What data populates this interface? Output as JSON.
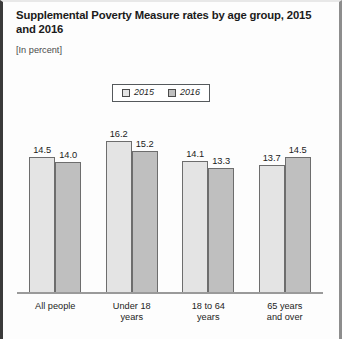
{
  "chart_data": {
    "type": "bar",
    "title": "Supplemental Poverty Measure rates by age group, 2015 and 2016",
    "subtitle": "[In percent]",
    "xlabel": "",
    "ylabel": "",
    "ylim": [
      0,
      18.5
    ],
    "grid": false,
    "legend_position": "top-center",
    "categories": [
      "All people",
      "Under 18 years",
      "18 to 64 years",
      "65 years and over"
    ],
    "category_lines": [
      {
        "line1": "All people",
        "line2": ""
      },
      {
        "line1": "Under 18",
        "line2": "years"
      },
      {
        "line1": "18 to 64",
        "line2": "years"
      },
      {
        "line1": "65 years",
        "line2": "and over"
      }
    ],
    "series": [
      {
        "name": "2015",
        "color": "#e4e4e4",
        "values": [
          14.5,
          16.2,
          14.1,
          13.7
        ],
        "labels": [
          "14.5",
          "16.2",
          "14.1",
          "13.7"
        ]
      },
      {
        "name": "2016",
        "color": "#bfbfbf",
        "values": [
          14.0,
          15.2,
          13.3,
          14.5
        ],
        "labels": [
          "14.0",
          "15.2",
          "13.3",
          "14.5"
        ]
      }
    ]
  },
  "legend": {
    "entries": [
      {
        "label": "2015",
        "swatch": "light-gray-swatch"
      },
      {
        "label": "2016",
        "swatch": "medium-gray-swatch"
      }
    ]
  },
  "colors": {
    "series_2015": "#e4e4e4",
    "series_2016": "#bfbfbf",
    "bar_outline": "#6d6d6d",
    "axis": "#9a9a9a",
    "text": "#1b1b1b",
    "frame_left": "#3a3a3a",
    "frame_right": "#8d8d8d"
  }
}
